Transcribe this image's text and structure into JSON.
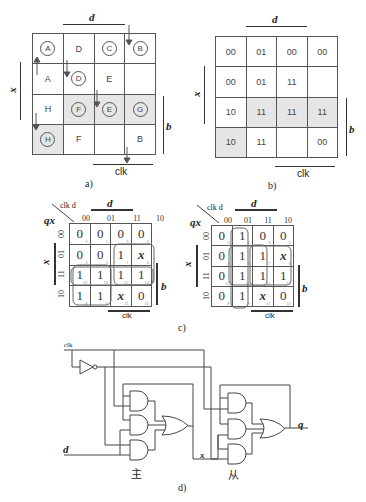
{
  "panel_a": {
    "caption": "a)",
    "label_d": "d",
    "label_x": "x",
    "label_b": "b",
    "label_clk": "clk",
    "cells": [
      [
        {
          "text": "A",
          "circled": true,
          "shade": false
        },
        {
          "text": "D",
          "circled": false,
          "shade": false
        },
        {
          "text": "C",
          "circled": true,
          "shade": false
        },
        {
          "text": "B",
          "circled": true,
          "shade": false
        }
      ],
      [
        {
          "text": "A",
          "circled": false,
          "shade": false
        },
        {
          "text": "D",
          "circled": true,
          "shade": false
        },
        {
          "text": "E",
          "circled": false,
          "shade": false
        },
        {
          "text": "",
          "circled": false,
          "shade": false
        }
      ],
      [
        {
          "text": "H",
          "circled": false,
          "shade": false
        },
        {
          "text": "F",
          "circled": true,
          "shade": true
        },
        {
          "text": "E",
          "circled": true,
          "shade": true
        },
        {
          "text": "G",
          "circled": true,
          "shade": true
        }
      ],
      [
        {
          "text": "H",
          "circled": true,
          "shade": true
        },
        {
          "text": "F",
          "circled": false,
          "shade": false
        },
        {
          "text": "",
          "circled": false,
          "shade": false
        },
        {
          "text": "B",
          "circled": false,
          "shade": false
        }
      ]
    ]
  },
  "panel_b": {
    "caption": "b)",
    "label_d": "d",
    "label_x": "x",
    "label_b": "b",
    "label_clk": "clk",
    "cells": [
      [
        {
          "text": "00",
          "shade": false
        },
        {
          "text": "01",
          "shade": false
        },
        {
          "text": "00",
          "shade": false
        },
        {
          "text": "00",
          "shade": false
        }
      ],
      [
        {
          "text": "00",
          "shade": false
        },
        {
          "text": "01",
          "shade": false
        },
        {
          "text": "11",
          "shade": false
        },
        {
          "text": "",
          "shade": false
        }
      ],
      [
        {
          "text": "10",
          "shade": false
        },
        {
          "text": "11",
          "shade": true
        },
        {
          "text": "11",
          "shade": true
        },
        {
          "text": "11",
          "shade": true
        }
      ],
      [
        {
          "text": "10",
          "shade": true
        },
        {
          "text": "11",
          "shade": false
        },
        {
          "text": "",
          "shade": false
        },
        {
          "text": "00",
          "shade": false
        }
      ]
    ]
  },
  "panel_c": {
    "caption": "c)",
    "left": {
      "corner_top": "clk d",
      "corner_left": "qx",
      "label_d": "d",
      "label_x": "x",
      "label_b": "b",
      "label_clk": "clk",
      "col_headers": [
        "00",
        "01",
        "11",
        "10"
      ],
      "row_headers": [
        "00",
        "01",
        "11",
        "10"
      ],
      "cells": [
        [
          {
            "v": "0",
            "n": "0"
          },
          {
            "v": "0",
            "n": "1"
          },
          {
            "v": "0",
            "n": "3"
          },
          {
            "v": "0",
            "n": "2"
          }
        ],
        [
          {
            "v": "0",
            "n": "4"
          },
          {
            "v": "0",
            "n": "5"
          },
          {
            "v": "1",
            "n": "7"
          },
          {
            "v": "x",
            "n": "6"
          }
        ],
        [
          {
            "v": "1",
            "n": "12"
          },
          {
            "v": "1",
            "n": "13"
          },
          {
            "v": "1",
            "n": "15"
          },
          {
            "v": "1",
            "n": "14"
          }
        ],
        [
          {
            "v": "1",
            "n": "8"
          },
          {
            "v": "1",
            "n": "9"
          },
          {
            "v": "x",
            "n": "11"
          },
          {
            "v": "0",
            "n": "10"
          }
        ]
      ]
    },
    "right": {
      "corner_top": "clk d",
      "corner_left": "qx",
      "label_d": "d",
      "label_x": "x",
      "label_b": "b",
      "label_clk": "clk",
      "col_headers": [
        "00",
        "01",
        "11",
        "10"
      ],
      "row_headers": [
        "00",
        "01",
        "11",
        "10"
      ],
      "cells": [
        [
          {
            "v": "0",
            "n": "0"
          },
          {
            "v": "1",
            "n": "1"
          },
          {
            "v": "0",
            "n": "3"
          },
          {
            "v": "0",
            "n": "2"
          }
        ],
        [
          {
            "v": "0",
            "n": "4"
          },
          {
            "v": "1",
            "n": "5"
          },
          {
            "v": "1",
            "n": "7"
          },
          {
            "v": "x",
            "n": "6"
          }
        ],
        [
          {
            "v": "0",
            "n": "12"
          },
          {
            "v": "1",
            "n": "13"
          },
          {
            "v": "1",
            "n": "15"
          },
          {
            "v": "1",
            "n": "14"
          }
        ],
        [
          {
            "v": "0",
            "n": "8"
          },
          {
            "v": "1",
            "n": "9"
          },
          {
            "v": "x",
            "n": "11"
          },
          {
            "v": "0",
            "n": "10"
          }
        ]
      ]
    }
  },
  "panel_d": {
    "caption": "d)",
    "input_clk": "clk",
    "input_d": "d",
    "wire_x": "x",
    "output_q": "q",
    "master_label": "主",
    "slave_label": "从"
  }
}
